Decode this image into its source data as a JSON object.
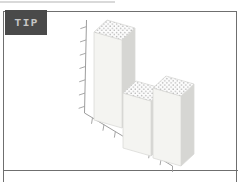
{
  "tip": {
    "label": "TIP"
  },
  "colors": {
    "badge_bg": "#4a4a4a",
    "badge_text": "#c6c6c6",
    "panel_border": "#6f6f6f",
    "axis": "#9d9d9d",
    "bar_front": "#f4f4f1",
    "bar_side": "#d6d6d3",
    "bar_top": "#fcfcfc",
    "bar_edge": "#d8d8d5",
    "dot": "#b5b5b5"
  },
  "chart_data": {
    "type": "bar",
    "style": "3d-isometric clipart illustration, dotted top faces",
    "title": "",
    "xlabel": "",
    "ylabel": "",
    "categories": [
      "",
      "",
      ""
    ],
    "values": [
      88,
      55,
      70
    ],
    "value_note": "relative bar heights in px; chart is decorative, no numeric labels shown",
    "bars": [
      {
        "x": 94,
        "base_y": 120,
        "height": 88
      },
      {
        "x": 123,
        "base_y": 148,
        "height": 55
      },
      {
        "x": 153,
        "base_y": 158,
        "height": 70
      }
    ],
    "y_axis": {
      "tick_count": 7,
      "labels": [],
      "top": [
        86.5,
        20
      ],
      "bottom": [
        84.5,
        113
      ]
    },
    "x_axis": {
      "tick_count": 7,
      "labels": [],
      "start": [
        84.5,
        113
      ],
      "end": [
        172.5,
        166
      ]
    },
    "legend": null,
    "grid": false
  }
}
